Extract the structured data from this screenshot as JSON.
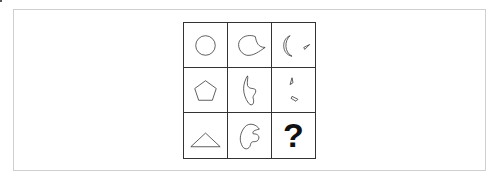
{
  "puzzle": {
    "type": "3x3 matrix reasoning",
    "rows": [
      [
        "circle",
        "curved-blob",
        "crescent-and-small-triangle"
      ],
      [
        "pentagon",
        "curved-hook-shape",
        "two-small-slivers"
      ],
      [
        "triangle",
        "curved-claw-shape",
        "question-mark"
      ]
    ],
    "missing_label": "?"
  },
  "colors": {
    "stroke": "#333333",
    "frame_border": "#cfcfcf",
    "background": "#ffffff"
  }
}
